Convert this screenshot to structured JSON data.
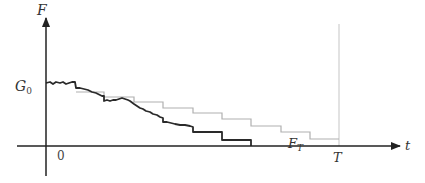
{
  "labels": {
    "y_axis": "F",
    "x_axis": "t",
    "origin": "0",
    "g0": "G",
    "g0_sub": "0",
    "terminal_time": "T",
    "ft": "F",
    "ft_sub": "T"
  },
  "colors": {
    "axis": "#222222",
    "path": "#2a2a2a",
    "staircase": "#b0b0b0",
    "terminal_line": "#cfcfcf"
  },
  "geometry": {
    "origin": [
      46,
      146
    ],
    "x_axis_range": [
      17,
      400
    ],
    "y_axis_range": [
      18,
      176
    ],
    "T_x": 339,
    "G0_y": 83
  },
  "staircase_points": "76,92 104,92 104,97 134,97 134,102 163,102 163,108 193,108 193,113 222,113 222,119 251,119 251,126 281,126 281,132 310,132 310,139 339,139",
  "path_points": "46,83 50,82 53,84 56,82 60,83 63,82 66,84 69,83 72,82 75,82 76,88 80,88 84,89 88,90 92,92 96,93 100,95 102,96 104,96 104,101 107,100 110,101 113,100 116,100 119,99 122,98 125,99 128,100 130,101 134,104 137,106 140,108 143,109 146,111 150,112 153,114 157,115 160,117 163,118 163,122 167,122 171,123 175,124 180,125 185,125 190,126 193,127 193,132 200,132 207,132 215,132 222,132 222,140 230,140 240,140 251,140 251,146"
}
